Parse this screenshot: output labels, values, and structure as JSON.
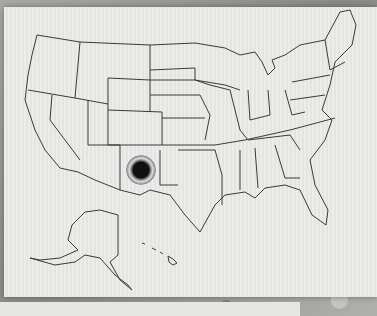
{
  "scene": {
    "subject": "Outline map of the United States printed on paper",
    "marker": {
      "state": "New Mexico",
      "style": "black dot with halo",
      "color": "#111111"
    },
    "insets": [
      "Alaska",
      "Hawaii"
    ],
    "paper_color": "#e8e8e6",
    "line_color": "#3a3a3a"
  }
}
